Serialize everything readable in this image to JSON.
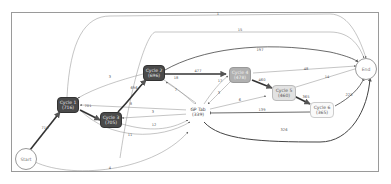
{
  "diagram": {
    "type": "process-flow",
    "nodes": {
      "start": {
        "label": "Start"
      },
      "end": {
        "label": "End"
      },
      "cycle1": {
        "label": "Cycle 1",
        "count": "(716)"
      },
      "cycle2": {
        "label": "Cycle 2",
        "count": "(696)"
      },
      "cycle3": {
        "label": "Cycle 3",
        "count": "(705)"
      },
      "cycle4": {
        "label": "Cycle 4",
        "count": "(478)"
      },
      "cycle5": {
        "label": "Cycle 5",
        "count": "(460)"
      },
      "cycle6": {
        "label": "Cycle 6",
        "count": "(365)"
      },
      "gptab": {
        "label": "GP Tab",
        "count": "(339)"
      }
    },
    "edges": [
      {
        "from": "cycle1",
        "to": "end",
        "label": "1"
      },
      {
        "from": "cycle3",
        "to": "end",
        "label": "15"
      },
      {
        "from": "cycle2",
        "to": "end",
        "label": "197"
      },
      {
        "from": "cycle2",
        "to": "cycle1",
        "label": "3"
      },
      {
        "from": "cycle2",
        "to": "cycle4",
        "label": "477"
      },
      {
        "from": "cycle4",
        "to": "end",
        "label": "48"
      },
      {
        "from": "cycle5",
        "to": "end",
        "label": "14"
      },
      {
        "from": "cycle4",
        "to": "cycle5",
        "label": "460"
      },
      {
        "from": "cycle5",
        "to": "cycle6",
        "label": "365"
      },
      {
        "from": "cycle6",
        "to": "end",
        "label": "225"
      },
      {
        "from": "cycle6",
        "to": "gptab",
        "label": "139"
      },
      {
        "from": "gptab",
        "to": "end",
        "label": "326"
      },
      {
        "from": "cycle3",
        "to": "cycle2",
        "label": "696"
      },
      {
        "from": "cycle1",
        "to": "cycle3",
        "label": "701"
      },
      {
        "from": "start",
        "to": "cycle1",
        "label": "716"
      },
      {
        "from": "start",
        "to": "gptab",
        "label": "4"
      },
      {
        "from": "gptab",
        "to": "cycle1",
        "label": "8"
      },
      {
        "from": "gptab",
        "to": "cycle3",
        "label": "3"
      },
      {
        "from": "cycle3",
        "to": "gptab",
        "label": "12"
      },
      {
        "from": "cycle1",
        "to": "gptab",
        "label": "11"
      },
      {
        "from": "cycle2",
        "to": "gptab",
        "label": "18"
      },
      {
        "from": "gptab",
        "to": "cycle2",
        "label": "7"
      },
      {
        "from": "gptab",
        "to": "cycle4",
        "label": "3"
      },
      {
        "from": "cycle4",
        "to": "gptab",
        "label": "17"
      },
      {
        "from": "cycle5",
        "to": "gptab",
        "label": "6"
      }
    ]
  }
}
